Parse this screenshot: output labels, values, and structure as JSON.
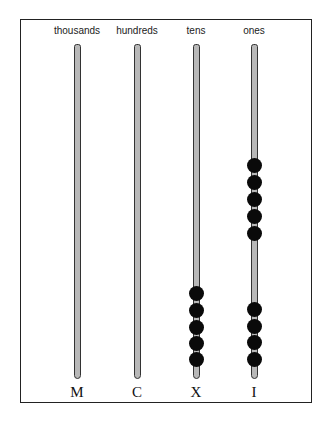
{
  "diagram": {
    "columns": [
      {
        "header": "thousands",
        "numeral": "M",
        "x": 77,
        "beads": 0,
        "bead_y": []
      },
      {
        "header": "hundreds",
        "numeral": "C",
        "x": 137,
        "beads": 0,
        "bead_y": []
      },
      {
        "header": "tens",
        "numeral": "X",
        "x": 196,
        "beads": 5,
        "bead_y": [
          293,
          310,
          327,
          343,
          359
        ]
      },
      {
        "header": "ones",
        "numeral": "I",
        "x": 254,
        "beads": 9,
        "bead_y": [
          165,
          182,
          199,
          216,
          233,
          309,
          326,
          342,
          359
        ]
      }
    ],
    "rod": {
      "top": 44,
      "bottom": 377
    },
    "colors": {
      "rod_fill": "#b8b8b8",
      "rod_stroke": "#333333",
      "bead": "#0a0a0a",
      "frame": "#222222"
    }
  }
}
